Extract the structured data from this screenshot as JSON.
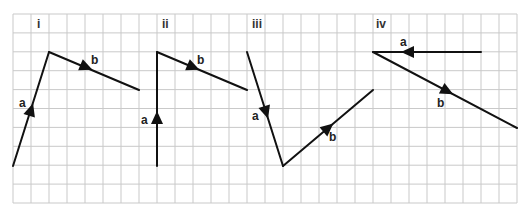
{
  "grid": {
    "origin_x": 13,
    "origin_y": 14,
    "cols": 28,
    "rows": 10,
    "cell_w": 18,
    "cell_h": 18.9,
    "line_color": "#c9c9c9"
  },
  "parts": [
    {
      "label": "i",
      "label_pos": [
        37,
        28
      ],
      "vectors": [
        {
          "name": "a",
          "from": [
            13,
            166
          ],
          "to": [
            49,
            52
          ],
          "arrow_at": [
            31,
            110
          ],
          "label_pos": [
            19,
            107
          ]
        },
        {
          "name": "b",
          "from": [
            49,
            52
          ],
          "to": [
            139,
            90
          ],
          "arrow_at": [
            86,
            67
          ],
          "label_pos": [
            91,
            64
          ]
        }
      ]
    },
    {
      "label": "ii",
      "label_pos": [
        162,
        28
      ],
      "vectors": [
        {
          "name": "a",
          "from": [
            157,
            166
          ],
          "to": [
            157,
            52
          ],
          "arrow_at": [
            157,
            118
          ],
          "label_pos": [
            141,
            124
          ]
        },
        {
          "name": "b",
          "from": [
            157,
            52
          ],
          "to": [
            247,
            90
          ],
          "arrow_at": [
            193,
            67
          ],
          "label_pos": [
            197,
            64
          ]
        }
      ]
    },
    {
      "label": "iii",
      "label_pos": [
        252,
        28
      ],
      "vectors": [
        {
          "name": "a",
          "from": [
            247,
            52
          ],
          "to": [
            283,
            166
          ],
          "arrow_at": [
            266,
            112
          ],
          "label_pos": [
            252,
            120
          ]
        },
        {
          "name": "b",
          "from": [
            283,
            166
          ],
          "to": [
            373,
            90
          ],
          "arrow_at": [
            328,
            128
          ],
          "label_pos": [
            329,
            141
          ]
        }
      ]
    },
    {
      "label": "iv",
      "label_pos": [
        376,
        28
      ],
      "vectors": [
        {
          "name": "a",
          "from": [
            481,
            52
          ],
          "to": [
            373,
            52
          ],
          "arrow_at": [
            408,
            52
          ],
          "label_pos": [
            400,
            46
          ]
        },
        {
          "name": "b",
          "from": [
            373,
            52
          ],
          "to": [
            517,
            128
          ],
          "arrow_at": [
            447,
            91
          ],
          "label_pos": [
            437,
            107
          ]
        }
      ]
    }
  ]
}
